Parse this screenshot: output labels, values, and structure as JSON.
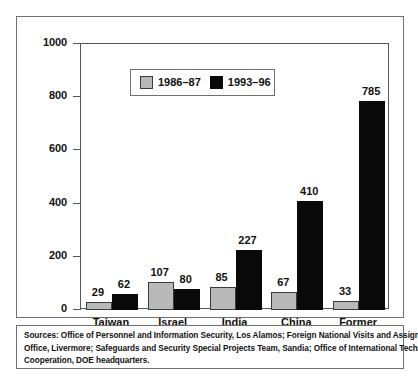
{
  "chart_data": {
    "type": "bar",
    "title": "",
    "subtitle": "",
    "xlabel": "",
    "ylabel": "",
    "ylim": [
      0,
      1000
    ],
    "ytick_labels": [
      "0",
      "200",
      "400",
      "600",
      "800",
      "1000"
    ],
    "ytick_values": [
      0,
      200,
      400,
      600,
      800,
      1000
    ],
    "yminor_values": [
      100,
      300,
      500,
      700,
      900
    ],
    "grid": false,
    "legend_position": "inside-upper-left",
    "categories": [
      "Taiwan",
      "Israel",
      "India",
      "China",
      "Former\nSoviet Union"
    ],
    "series": [
      {
        "name": "1986–87",
        "color": "#b9b9b9",
        "values": [
          29,
          107,
          85,
          67,
          33
        ]
      },
      {
        "name": "1993–96",
        "color": "#090909",
        "values": [
          62,
          80,
          227,
          410,
          785
        ]
      }
    ],
    "data_labels": [
      "29",
      "62",
      "107",
      "80",
      "85",
      "227",
      "67",
      "410",
      "33",
      "785"
    ]
  },
  "legend": {
    "items": [
      {
        "label": "1986–87",
        "swatch": "gray-swatch"
      },
      {
        "label": "1993–96",
        "swatch": "black-swatch"
      }
    ]
  },
  "source": {
    "lines": [
      "Sources: Office of Personnel and Information Security, Los Alamos; Foreign National Visits and Assignments",
      "Office, Livermore; Safeguards and Security Special Projects Team, Sandia; Office of International Technology",
      "Cooperation, DOE headquarters."
    ]
  },
  "colors": {
    "series_a": "#b9b9b9",
    "series_b": "#090909",
    "frame": "#6f6f6f",
    "axis": "#555555",
    "text": "#111111",
    "background": "#ffffff"
  }
}
